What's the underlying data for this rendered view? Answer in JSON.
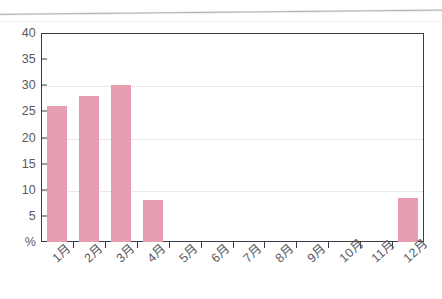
{
  "chart_data": {
    "type": "bar",
    "title": "",
    "subtitle": "",
    "xlabel": "",
    "ylabel": "%",
    "ylim": [
      0,
      40
    ],
    "ytick_values": [
      0,
      5,
      10,
      15,
      20,
      25,
      30,
      35,
      40
    ],
    "ytick_labels": [
      "%",
      "5",
      "10",
      "15",
      "20",
      "25",
      "30",
      "35",
      "40"
    ],
    "grid": true,
    "gridlines_at": [
      10,
      20,
      30
    ],
    "legend": null,
    "legend_position": "none",
    "categories": [
      "1月",
      "2月",
      "3月",
      "4月",
      "5月",
      "6月",
      "7月",
      "8月",
      "9月",
      "10月",
      "11月",
      "12月"
    ],
    "values": [
      26,
      28,
      30,
      8,
      0,
      0,
      0,
      0,
      0,
      0,
      0,
      8.5
    ],
    "bar_color": "#e49aac",
    "axis_color": "#3c3c42",
    "grid_color": "#d9c9cf",
    "label_color": "#5a5a60"
  },
  "axes": {
    "y_label_unit": "%",
    "x_rotation_degrees": -42
  }
}
